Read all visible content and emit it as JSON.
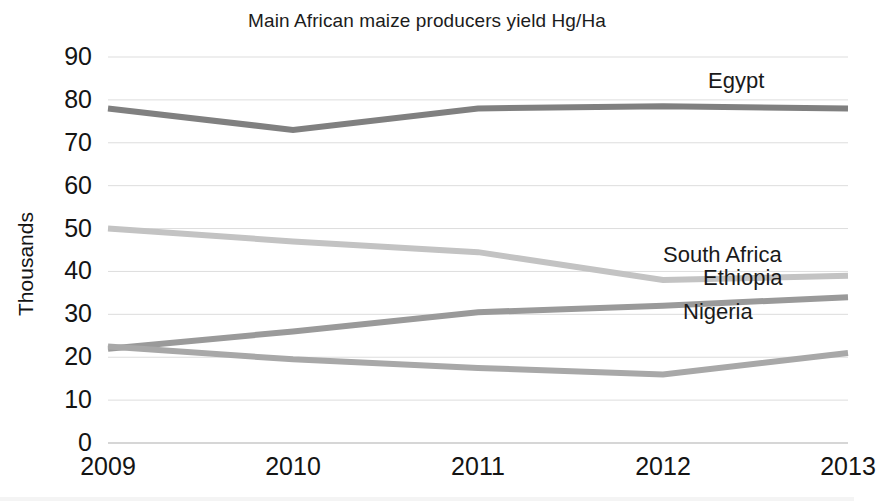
{
  "chart_data": {
    "type": "line",
    "title": "Main African maize producers yield Hg/Ha",
    "xlabel": "",
    "ylabel": "Thousands",
    "categories": [
      "2009",
      "2010",
      "2011",
      "2012",
      "2013"
    ],
    "ylim": [
      0,
      90
    ],
    "ytick_step": 10,
    "yticks": [
      "90",
      "80",
      "70",
      "60",
      "50",
      "40",
      "30",
      "20",
      "10",
      "0"
    ],
    "grid": "horizontal",
    "legend_position": "inline-right-labels",
    "series": [
      {
        "name": "Egypt",
        "values": [
          78,
          73,
          78,
          78.5,
          78
        ],
        "color": "#808080"
      },
      {
        "name": "South Africa",
        "values": [
          50,
          47,
          44.5,
          38,
          39
        ],
        "color": "#c3c3c3"
      },
      {
        "name": "Ethiopia",
        "values": [
          22,
          26,
          30.5,
          32,
          34
        ],
        "color": "#9a9a9a"
      },
      {
        "name": "Nigeria",
        "values": [
          22.5,
          19.5,
          17.5,
          16,
          21
        ],
        "color": "#a8a8a8"
      }
    ]
  }
}
